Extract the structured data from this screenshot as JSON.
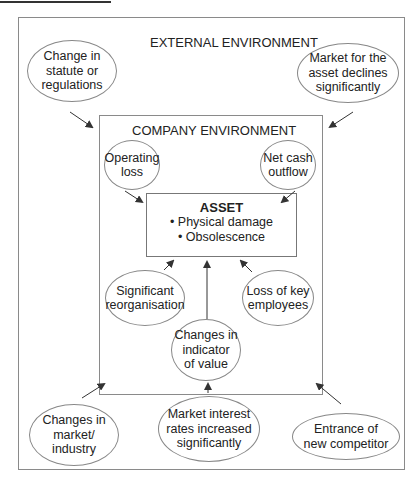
{
  "diagram": {
    "outer_label": "EXTERNAL ENVIRONMENT",
    "inner_label": "COMPANY ENVIRONMENT",
    "asset": {
      "title": "ASSET",
      "bullets": [
        "• Physical damage",
        "• Obsolescence"
      ]
    },
    "external_factors": {
      "statute": "Change in\nstatute or\nregulations",
      "market_decline": "Market for the\nasset declines\nsignificantly",
      "market_industry": "Changes in\nmarket/\nindustry",
      "interest_rates": "Market interest\nrates increased\nsignificantly",
      "competitor": "Entrance of\nnew competitor"
    },
    "internal_factors": {
      "operating_loss": "Operating\nloss",
      "net_cash_outflow": "Net cash\noutflow",
      "reorganisation": "Significant\nreorganisation",
      "key_employees": "Loss of key\nemployees",
      "indicator_value": "Changes in\nindicator\nof value"
    },
    "colors": {
      "line": "#8a8a8a",
      "arrow": "#333333",
      "text": "#222222"
    }
  }
}
